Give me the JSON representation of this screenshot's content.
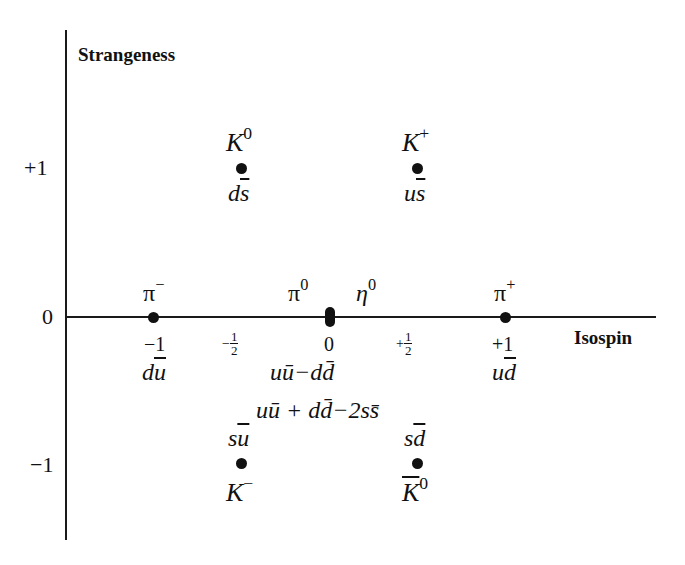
{
  "axes": {
    "y_label": "Strangeness",
    "x_label": "Isospin",
    "y_ticks": [
      "+1",
      "0",
      "−1"
    ],
    "x_ticks": [
      {
        "label": "−1",
        "value": -1
      },
      {
        "sign": "−",
        "num": "1",
        "den": "2",
        "value": -0.5
      },
      {
        "label": "0",
        "value": 0
      },
      {
        "sign": "+",
        "num": "1",
        "den": "2",
        "value": 0.5
      },
      {
        "label": "+1",
        "value": 1
      }
    ]
  },
  "particles": [
    {
      "name": "K",
      "sup": "0",
      "quarks_a": "d",
      "quarks_b": "s",
      "isospin": -0.5,
      "strangeness": 1
    },
    {
      "name": "K",
      "sup": "+",
      "quarks_a": "u",
      "quarks_b": "s",
      "isospin": 0.5,
      "strangeness": 1
    },
    {
      "name": "π",
      "sup": "−",
      "quarks_a": "d",
      "quarks_b": "u",
      "isospin": -1,
      "strangeness": 0
    },
    {
      "name": "π",
      "sup": "0",
      "quarks": "uū−dd̄",
      "isospin": 0,
      "strangeness": 0
    },
    {
      "name": "η",
      "sup": "0",
      "quarks": "uū + dd̄−2ss̄",
      "isospin": 0,
      "strangeness": 0
    },
    {
      "name": "π",
      "sup": "+",
      "quarks_a": "u",
      "quarks_b": "d",
      "isospin": 1,
      "strangeness": 0
    },
    {
      "name": "K",
      "sup": "−",
      "quarks_a": "s",
      "quarks_b": "u",
      "isospin": -0.5,
      "strangeness": -1
    },
    {
      "name": "K",
      "sup": "0",
      "bar": true,
      "quarks_a": "s",
      "quarks_b": "d",
      "isospin": 0.5,
      "strangeness": -1
    }
  ],
  "labels": {
    "pi0_quarks": "uū−dd̄",
    "eta0_quarks": "uū + dd̄−2ss̄"
  }
}
